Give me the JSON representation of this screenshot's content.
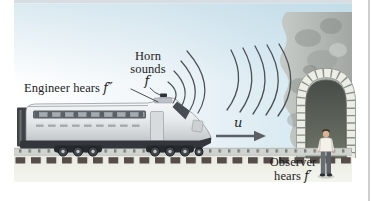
{
  "figure": {
    "labels": {
      "engineer": {
        "text": "Engineer hears ",
        "symbol": "f″"
      },
      "horn": {
        "line1": "Horn",
        "line2": "sounds",
        "symbol": "f"
      },
      "velocity": {
        "symbol": "u"
      },
      "observer": {
        "line1": "Observer",
        "line2": "hears ",
        "symbol": "f′"
      }
    },
    "colors": {
      "sky": "#d3e7f0",
      "ground": "#e7eadf",
      "cliff": "#a9aeaa",
      "tunnel_interior": "#4e544d",
      "wave_lines": "#4b5054",
      "railroad_ties": "#564d49",
      "velocity_arrow": "#5a6065",
      "text": "#1c1c1c"
    }
  }
}
